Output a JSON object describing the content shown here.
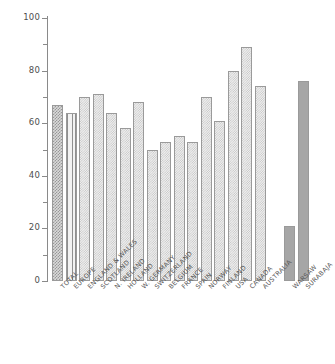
{
  "chart_data": {
    "type": "bar",
    "title": "",
    "xlabel": "",
    "ylabel": "percentage",
    "ylim": [
      0,
      100
    ],
    "yticks": [
      0,
      20,
      40,
      60,
      80,
      100
    ],
    "ytick_labels": [
      "0",
      "20",
      "40",
      "60",
      "80",
      "100"
    ],
    "minor_yticks": [
      10,
      30,
      50,
      70,
      90
    ],
    "grid": false,
    "legend": null,
    "categories": [
      "TOTAL",
      "EUROPE",
      "ENGLAND & WALES",
      "SCOTLAND",
      "N. IRELAND",
      "HOLLAND",
      "W. GERMANY",
      "SWITZERLAND",
      "BELGIUM",
      "FRANCE",
      "SPAIN",
      "NORWAY",
      "FINLAND",
      "USA",
      "CANADA",
      "AUSTRALIA",
      "WARSAW",
      "SURABAJA"
    ],
    "values": [
      67,
      64,
      70,
      71,
      64,
      58,
      68,
      50,
      53,
      55,
      53,
      70,
      61,
      80,
      89,
      74,
      21,
      76
    ],
    "bar_styles": [
      "crosshatch",
      "vertical",
      "dotted",
      "dotted",
      "dotted",
      "dotted",
      "dotted",
      "dotted",
      "dotted",
      "dotted",
      "dotted",
      "dotted",
      "dotted",
      "dotted",
      "dotted",
      "dotted",
      "solid",
      "solid"
    ],
    "group_gap_after_index": 15,
    "colors": {
      "axis": "#8a8a8a",
      "text": "#4e4e4e",
      "bar_outline": "#9a9a9a",
      "bar_light": "#efefef",
      "bar_solid": "#a6a6a6"
    }
  },
  "axis": {
    "y_title": "percentage"
  }
}
